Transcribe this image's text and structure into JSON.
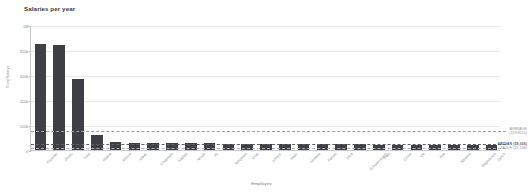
{
  "chart_data": {
    "type": "bar",
    "title": "Salaries per year",
    "xlabel": "Employee",
    "ylabel": "Sum(Salary)",
    "ylim": [
      0,
      1000000
    ],
    "grid": true,
    "legend_position": "right-annotations",
    "ytick_labels": [
      "1M",
      "800k",
      "600k",
      "400k",
      "200k",
      "0"
    ],
    "ytick_values": [
      1000000,
      800000,
      600000,
      400000,
      200000,
      0
    ],
    "categories": [
      "Fournier",
      "Jones",
      "Trent",
      "Reeve",
      "Alonso",
      "Meier",
      "Chapman",
      "Kaplan",
      "Novak",
      "Ali",
      "Bergman",
      "Osei",
      "Lorenz",
      "Haas",
      "Moreau",
      "Ferrari",
      "Silva",
      "Schwarzmann",
      "Petit",
      "Costa",
      "Ott",
      "Kim",
      "Navarro",
      "Magnusson",
      "Lynch"
    ],
    "values": [
      845000,
      838000,
      572000,
      118000,
      62000,
      60000,
      58000,
      56000,
      55000,
      54000,
      52000,
      51000,
      50000,
      49000,
      48000,
      47000,
      46000,
      45000,
      44000,
      43000,
      42000,
      41000,
      40000,
      39000,
      38000
    ],
    "bar_color": "#3f3f46",
    "annotations": [
      {
        "name": "average",
        "label_line1": "AVERAGE",
        "label_line2": "(159,851k)",
        "value": 159851,
        "style": "dashed",
        "color": "#9aa0a6"
      },
      {
        "name": "median",
        "label_line1": "MEDIAN (59,306)",
        "label_line2": "",
        "value": 59306,
        "style": "dashed",
        "color": "#5f6368"
      },
      {
        "name": "mode",
        "label_line1": "MODE (21,146)",
        "label_line2": "",
        "value": 21146,
        "style": "dashed",
        "color": "#a8adb2"
      }
    ]
  }
}
